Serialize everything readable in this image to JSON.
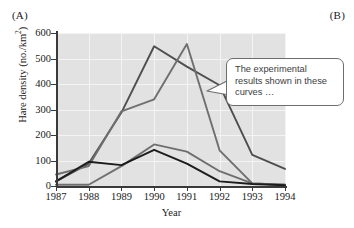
{
  "figure": {
    "panel_a_label": "(A)",
    "panel_b_label": "(B)"
  },
  "callout": {
    "text": "The experimental results shown in these curves …",
    "border_color": "#6d6d6d",
    "background": "#ffffff"
  },
  "colors": {
    "plot_background": "#e2e2e2",
    "gridline": "#f4f4f4",
    "axis": "#3a3a3a",
    "series_dark": "#4e4e4e",
    "series_black": "#1c1c1c",
    "series_gray": "#6f6f6f"
  },
  "chart_data": {
    "type": "line",
    "title": "",
    "xlabel": "Year",
    "ylabel": "Hare density (no./km2)",
    "ylabel_display": "Hare density (no./km²)",
    "x": [
      1987,
      1988,
      1989,
      1990,
      1991,
      1992,
      1993,
      1994
    ],
    "categories": [
      "1987",
      "1988",
      "1989",
      "1990",
      "1991",
      "1992",
      "1993",
      "1994"
    ],
    "xlim": [
      1987,
      1994
    ],
    "ylim": [
      0,
      600
    ],
    "yticks": [
      0,
      100,
      200,
      300,
      400,
      500,
      600
    ],
    "ytick_labels": [
      "0",
      "100",
      "200",
      "300",
      "400",
      "500",
      "600"
    ],
    "grid": true,
    "legend": "none",
    "series": [
      {
        "name": "food + predator exclosure",
        "color": "#4e4e4e",
        "values": [
          18,
          88,
          288,
          548,
          468,
          395,
          122,
          67
        ]
      },
      {
        "name": "food addition",
        "color": "#6f6f6f",
        "values": [
          45,
          78,
          293,
          340,
          557,
          140,
          10,
          5
        ]
      },
      {
        "name": "predator exclosure",
        "color": "#6f6f6f",
        "values": [
          5,
          5,
          78,
          163,
          135,
          58,
          10,
          5
        ]
      },
      {
        "name": "control",
        "color": "#1c1c1c",
        "values": [
          18,
          95,
          82,
          142,
          88,
          18,
          8,
          3
        ]
      }
    ]
  }
}
